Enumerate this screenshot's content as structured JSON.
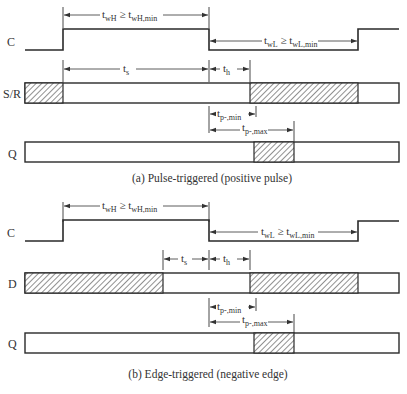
{
  "diagram": {
    "type": "timing-diagram",
    "colors": {
      "line": "#2a2a2a",
      "hatch": "#555555",
      "background": "#ffffff"
    },
    "panel_a": {
      "caption": "(a) Pulse-triggered (positive pulse)",
      "signals": {
        "clock": "C",
        "input": "S/R",
        "output": "Q"
      },
      "labels": {
        "twH_main": "t",
        "twH_sub": "wH",
        "twH_rel": " ≥ t",
        "twH_min_sub": "wH,min",
        "twL_main": "t",
        "twL_sub": "wL",
        "twL_rel": " ≥ t",
        "twL_min_sub": "wL,min",
        "ts_main": "t",
        "ts_sub": "s",
        "th_main": "t",
        "th_sub": "h",
        "tpmin_main": "t",
        "tpmin_sub": "p-,min",
        "tpmax_main": "t",
        "tpmax_sub": "p-,max"
      }
    },
    "panel_b": {
      "caption": "(b) Edge-triggered (negative edge)",
      "signals": {
        "clock": "C",
        "input": "D",
        "output": "Q"
      },
      "labels": {
        "twH_main": "t",
        "twH_sub": "wH",
        "twH_rel": " ≥ t",
        "twH_min_sub": "wH,min",
        "twL_main": "t",
        "twL_sub": "wL",
        "twL_rel": " ≥ t",
        "twL_min_sub": "wL,min",
        "ts_main": "t",
        "ts_sub": "s",
        "th_main": "t",
        "th_sub": "h",
        "tpmin_main": "t",
        "tpmin_sub": "p-,min",
        "tpmax_main": "t",
        "tpmax_sub": "p-,max"
      }
    }
  }
}
